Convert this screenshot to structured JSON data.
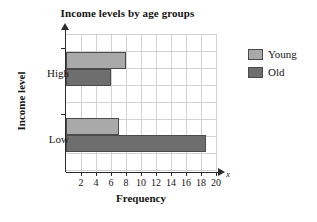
{
  "chart_data": {
    "type": "bar",
    "orientation": "horizontal",
    "title": "Income levels by age groups",
    "xlabel": "Frequency",
    "ylabel": "Income level",
    "axis_variable": "x",
    "categories": [
      "High",
      "Low"
    ],
    "series": [
      {
        "name": "Young",
        "color": "#a9a9a9",
        "values": [
          8,
          7
        ]
      },
      {
        "name": "Old",
        "color": "#6e6e6e",
        "values": [
          6,
          18.7
        ]
      }
    ],
    "xlim": [
      0,
      20
    ],
    "xticks": [
      2,
      4,
      6,
      8,
      10,
      12,
      14,
      16,
      18,
      20
    ],
    "grid": true,
    "grid_step": 2,
    "legend_position": "right"
  }
}
